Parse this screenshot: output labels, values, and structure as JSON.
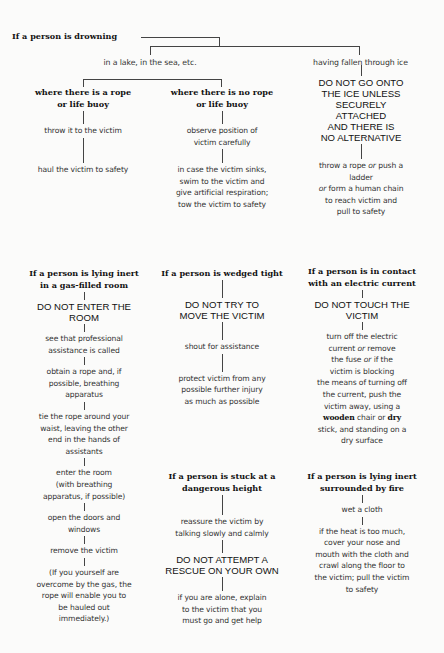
{
  "drowning": {
    "title": "If a person is drowning",
    "branch_lake": "in a lake, in the sea, etc.",
    "branch_ice": "having fallen through ice",
    "rope": {
      "heading": [
        "where there is a rope",
        "or life buoy"
      ],
      "steps": [
        "throw it to the victim",
        "haul the victim to safety"
      ]
    },
    "no_rope": {
      "heading": [
        "where there is no rope",
        "or life buoy"
      ],
      "steps": [
        [
          "observe position of",
          "victim carefully"
        ],
        [
          "in case the victim sinks,",
          "swim to the victim and",
          "give artificial respiration;",
          "tow the victim to safety"
        ]
      ]
    },
    "ice": {
      "warning": [
        "DO NOT GO ONTO",
        "THE ICE UNLESS",
        "SECURELY",
        "ATTACHED",
        "AND THERE IS",
        "NO ALTERNATIVE"
      ],
      "step": {
        "l1a": "throw a rope ",
        "l1_or": "or",
        "l1b": " push a",
        "l2": "ladder",
        "l3_or": "or",
        "l3b": " form a human chain",
        "l4": "to reach victim and",
        "l5": "pull to safety"
      }
    }
  },
  "gas": {
    "heading": [
      "If a person is lying inert",
      "in a gas-filled room"
    ],
    "warning": [
      "DO NOT ENTER THE",
      "ROOM"
    ],
    "steps": [
      [
        "see that professional",
        "assistance is called"
      ],
      [
        "obtain a rope and, if",
        "possible, breathing",
        "apparatus"
      ],
      [
        "tie the rope around your",
        "waist, leaving the other",
        "end in the hands of",
        "assistants"
      ],
      [
        "enter the room",
        "(with breathing",
        "apparatus, if possible)"
      ],
      [
        "open the doors and",
        "windows"
      ],
      [
        "remove the victim"
      ],
      [
        "(If you yourself are",
        "overcome by the gas, the",
        "rope will enable you to",
        "be hauled out",
        "immediately.)"
      ]
    ]
  },
  "wedged": {
    "heading": [
      "If a person is wedged tight"
    ],
    "warning": [
      "DO NOT TRY TO",
      "MOVE THE VICTIM"
    ],
    "steps": [
      [
        "shout for assistance"
      ],
      [
        "protect victim from any",
        "possible further injury",
        "as much as possible"
      ]
    ]
  },
  "height": {
    "heading": [
      "If a person is stuck at a",
      "dangerous height"
    ],
    "steps_before": [
      [
        "reassure the victim by",
        "talking slowly and calmly"
      ]
    ],
    "warning": [
      "DO NOT ATTEMPT A",
      "RESCUE ON YOUR OWN"
    ],
    "steps_after": [
      [
        "if you are alone, explain",
        "to the victim that you",
        "must go and get help"
      ]
    ]
  },
  "electric": {
    "heading": [
      "If a person is in contact",
      "with an electric current"
    ],
    "warning": [
      "DO NOT TOUCH THE",
      "VICTIM"
    ],
    "step": {
      "l1": "turn off the electric",
      "l2a": "current ",
      "l2_or": "or",
      "l2b": " remove",
      "l3a": "the fuse ",
      "l3_or": "or",
      "l3b": " if the",
      "l4": "victim is blocking",
      "l5": "the means of turning off",
      "l6": "the current, push the",
      "l7": "victim away, using a",
      "l8_b1": "wooden",
      "l8_mid": " chair or ",
      "l8_b2": "dry",
      "l9": "stick, and standing on a",
      "l10": "dry surface"
    }
  },
  "fire": {
    "heading": [
      "If a person is lying inert",
      "surrounded by fire"
    ],
    "steps": [
      [
        "wet a cloth"
      ],
      [
        "if the heat is too much,",
        "cover your nose and",
        "mouth with the cloth and",
        "crawl along the floor to",
        "the victim; pull the victim",
        "to safety"
      ]
    ]
  }
}
